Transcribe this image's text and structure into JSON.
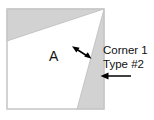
{
  "figure": {
    "background_color": "#ffffff",
    "shape": {
      "name": "square-outline",
      "border_color": "#c8c8c8",
      "fill_color": "#ffffff",
      "x": 7,
      "y": 9,
      "width": 97,
      "height": 100
    },
    "shaded_color": "#d2d2d2",
    "shaded_edge_color": "#b4b4b4",
    "regions": [
      {
        "name": "top-left-shaded-wedge",
        "points": "7,9 104,9 7,41"
      },
      {
        "name": "right-shaded-wedge",
        "points": "104,9 104,109 77,109"
      },
      {
        "name": "white-region-a",
        "points": "7,41 104,9 77,109 7,109"
      }
    ]
  },
  "labels": {
    "region_a": "A",
    "corner_1": "Corner 1",
    "type_2": "Type #2"
  },
  "annotations": [
    {
      "name": "double-headed-arrow",
      "type": "double-arrow",
      "x1": 73,
      "y1": 47,
      "x2": 90,
      "y2": 58,
      "color": "#000000"
    },
    {
      "name": "left-pointing-arrow",
      "type": "single-arrow",
      "x1": 131,
      "y1": 76,
      "x2": 101,
      "y2": 76,
      "color": "#000000"
    }
  ]
}
